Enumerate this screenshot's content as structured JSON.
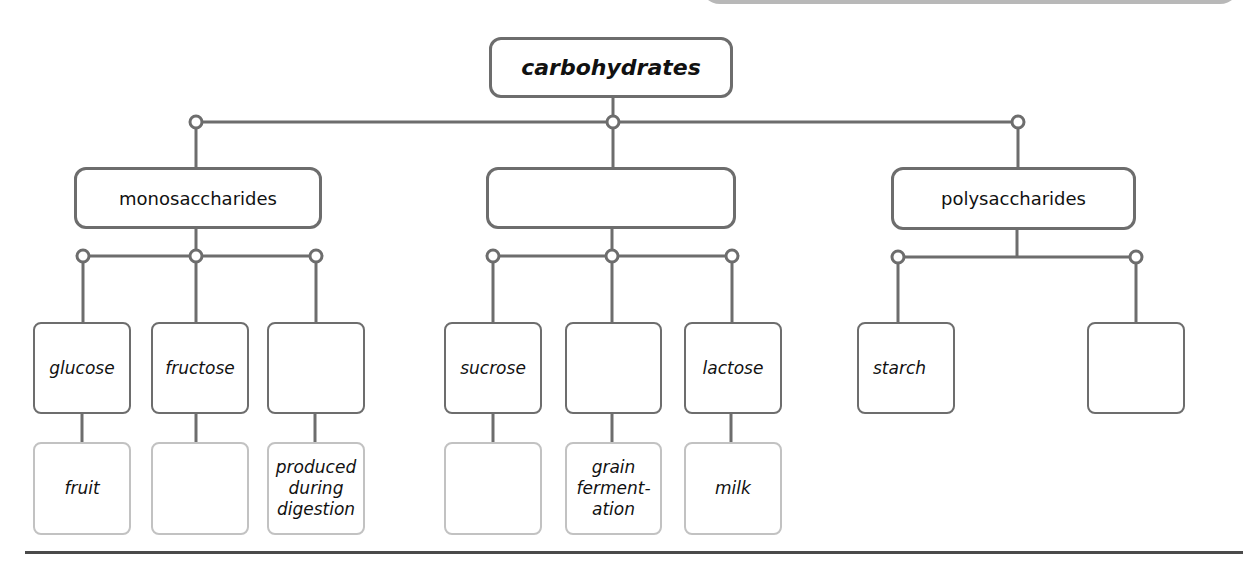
{
  "diagram": {
    "title": "carbohydrates",
    "categories": [
      {
        "label": "monosaccharides"
      },
      {
        "label": ""
      },
      {
        "label": "polysaccharides"
      }
    ],
    "items": [
      {
        "label": "glucose",
        "source": "fruit"
      },
      {
        "label": "fructose",
        "source": ""
      },
      {
        "label": "",
        "source": "produced during digestion"
      },
      {
        "label": "sucrose",
        "source": ""
      },
      {
        "label": "",
        "source": "grain ferment- ation"
      },
      {
        "label": "lactose",
        "source": "milk"
      },
      {
        "label": "starch"
      },
      {
        "label": ""
      }
    ],
    "colors": {
      "box_border": "#6d6d6d",
      "source_border": "#c2c2c2",
      "connector": "#6d6d6d",
      "text": "#111111"
    }
  }
}
